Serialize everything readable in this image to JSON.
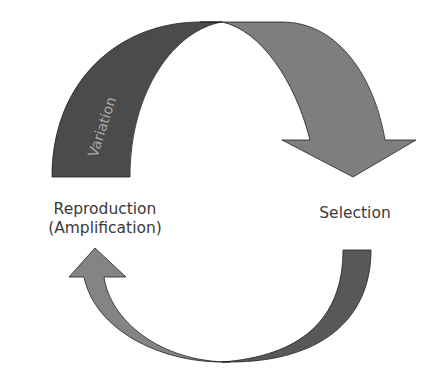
{
  "diagram": {
    "title": "",
    "nodes": [
      {
        "id": "reproduction",
        "label_line1": "Reproduction",
        "label_line2": "(Amplification)"
      },
      {
        "id": "selection",
        "label": "Selection"
      }
    ],
    "edges": [
      {
        "from": "reproduction",
        "to": "selection",
        "label": "Variation",
        "color": "#4a4a4a",
        "head_color": "#7a7a7a"
      },
      {
        "from": "selection",
        "to": "reproduction",
        "label": "",
        "color": "#5a5a5a",
        "head_color": "#838383"
      }
    ]
  },
  "colors": {
    "background": "#ffffff",
    "text": "#3a3a3a",
    "arrow_dark": "#4b4b4b",
    "arrow_mid": "#7d7d7d",
    "variation_text": "#a8a8a8",
    "outline": "#222222"
  }
}
